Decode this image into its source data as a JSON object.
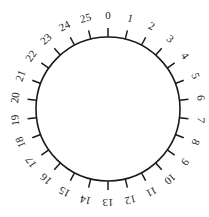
{
  "diagram": {
    "type": "circular-dial",
    "center": [
      108,
      109
    ],
    "radius": 72,
    "tick_length": 9,
    "label_radius": 94,
    "direction": "clockwise",
    "start": "top",
    "stroke_color": "#1a1a1a",
    "labels": [
      "0",
      "1",
      "2",
      "3",
      "4",
      "5",
      "6",
      "7",
      "8",
      "9",
      "10",
      "11",
      "12",
      "13",
      "14",
      "15",
      "16",
      "17",
      "18",
      "19",
      "20",
      "21",
      "22",
      "23",
      "24",
      "25"
    ]
  }
}
